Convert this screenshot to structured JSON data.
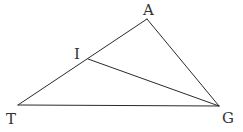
{
  "diagram": {
    "type": "geometry-triangle",
    "points": {
      "A": {
        "label": "A",
        "x": 147,
        "y": 19,
        "label_x": 143,
        "label_y": 15
      },
      "T": {
        "label": "T",
        "x": 18,
        "y": 105,
        "label_x": 6,
        "label_y": 124
      },
      "G": {
        "label": "G",
        "x": 219,
        "y": 106,
        "label_x": 222,
        "label_y": 123
      },
      "I": {
        "label": "I",
        "x": 88,
        "y": 59,
        "label_x": 74,
        "label_y": 59
      }
    },
    "segments": [
      {
        "from": "T",
        "to": "A"
      },
      {
        "from": "A",
        "to": "G"
      },
      {
        "from": "T",
        "to": "G"
      },
      {
        "from": "I",
        "to": "G"
      }
    ],
    "stroke_color": "#2a2a2a",
    "label_color": "#333333"
  }
}
